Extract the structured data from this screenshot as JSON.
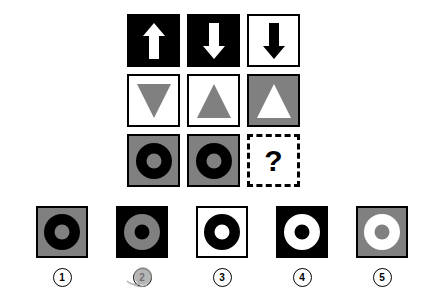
{
  "puzzle": {
    "type": "visual-analogy-matrix",
    "background_color": "#ffffff",
    "colors": {
      "black": "#000000",
      "white": "#ffffff",
      "gray": "#808080"
    },
    "matrix": {
      "rows": 3,
      "columns": 3,
      "cells": [
        {
          "id": "cell-r1c1",
          "row": 1,
          "col": 1,
          "background": "black",
          "shape": "arrow-up",
          "shape_color": "white",
          "name": "arrow-up-icon"
        },
        {
          "id": "cell-r1c2",
          "row": 1,
          "col": 2,
          "background": "black",
          "shape": "arrow-down",
          "shape_color": "white",
          "name": "arrow-down-icon"
        },
        {
          "id": "cell-r1c3",
          "row": 1,
          "col": 3,
          "background": "white",
          "shape": "arrow-down",
          "shape_color": "black",
          "name": "arrow-down-icon"
        },
        {
          "id": "cell-r2c1",
          "row": 2,
          "col": 1,
          "background": "white",
          "shape": "triangle-down",
          "shape_color": "gray",
          "name": "triangle-down-icon"
        },
        {
          "id": "cell-r2c2",
          "row": 2,
          "col": 2,
          "background": "white",
          "shape": "triangle-up",
          "shape_color": "gray",
          "name": "triangle-up-icon"
        },
        {
          "id": "cell-r2c3",
          "row": 2,
          "col": 3,
          "background": "gray",
          "shape": "triangle-up",
          "shape_color": "white",
          "name": "triangle-up-icon"
        },
        {
          "id": "cell-r3c1",
          "row": 3,
          "col": 1,
          "background": "gray",
          "shape": "ring",
          "shape_color": "black",
          "hole_color": "gray",
          "name": "ring-icon"
        },
        {
          "id": "cell-r3c2",
          "row": 3,
          "col": 2,
          "background": "gray",
          "shape": "ring",
          "shape_color": "black",
          "hole_color": "gray",
          "name": "ring-icon"
        },
        {
          "id": "cell-r3c3",
          "row": 3,
          "col": 3,
          "background": "white",
          "shape": "question-mark",
          "shape_color": "black",
          "border": "dashed",
          "name": "missing-cell"
        }
      ]
    },
    "missing_cell_text": "?",
    "options": [
      {
        "number": "1",
        "background": "gray",
        "ring_color": "black",
        "hole_color": "gray",
        "marked": false
      },
      {
        "number": "2",
        "background": "black",
        "ring_color": "gray",
        "hole_color": "black",
        "marked": true
      },
      {
        "number": "3",
        "background": "white",
        "ring_color": "black",
        "hole_color": "white",
        "marked": false
      },
      {
        "number": "4",
        "background": "black",
        "ring_color": "white",
        "hole_color": "black",
        "marked": false
      },
      {
        "number": "5",
        "background": "gray",
        "ring_color": "white",
        "hole_color": "gray",
        "marked": false
      }
    ]
  }
}
